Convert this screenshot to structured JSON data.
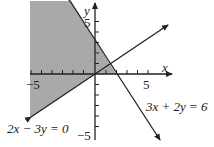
{
  "graph": {
    "x_axis_label": "x",
    "y_axis_label": "y",
    "x_tick_label_neg": "−5",
    "x_tick_label_pos": "5",
    "y_tick_label_pos": "5",
    "y_tick_label_neg": "−5",
    "line1_label": "3x + 2y = 6",
    "line2_label": "2x − 3y = 0",
    "shade_color": "#a9a9a9",
    "line_color": "#222222"
  }
}
